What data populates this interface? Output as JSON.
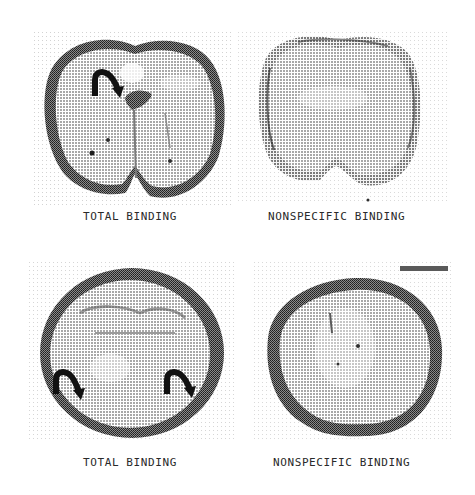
{
  "figure": {
    "panels": [
      {
        "id": "top-left",
        "caption": "TOTAL BINDING",
        "arrows": 1
      },
      {
        "id": "top-right",
        "caption": "NONSPECIFIC BINDING",
        "arrows": 0
      },
      {
        "id": "bottom-left",
        "caption": "TOTAL BINDING",
        "arrows": 2
      },
      {
        "id": "bottom-right",
        "caption": "NONSPECIFIC BINDING",
        "arrows": 0
      }
    ],
    "colors": {
      "background": "#ffffff",
      "tissue_light": "#bdbdbd",
      "tissue_dark": "#3a3a3a",
      "arrow": "#111111",
      "caption": "#2a2a2a"
    }
  }
}
